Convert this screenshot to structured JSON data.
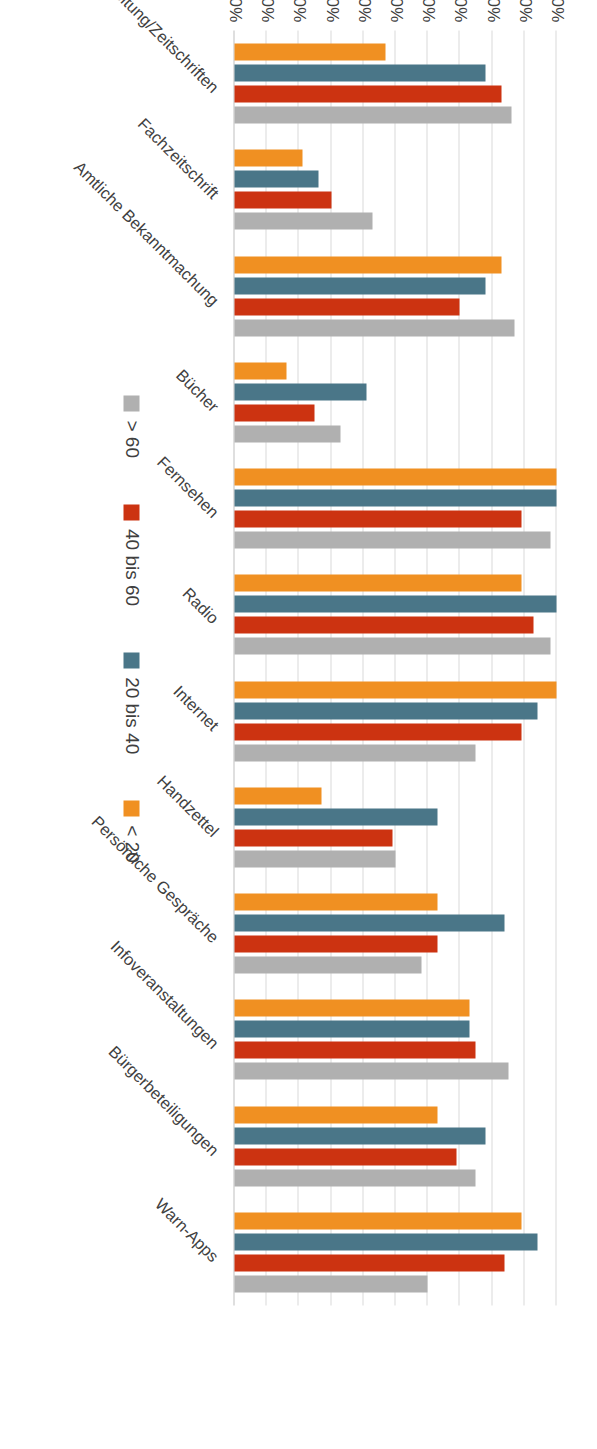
{
  "chart_data": {
    "type": "bar",
    "orientation": "horizontal-bars-rotated-page",
    "title": "",
    "subtitle": "",
    "xlabel": "",
    "ylabel": "",
    "grid": true,
    "legend_position": "right",
    "ylim": [
      0,
      100
    ],
    "value_ticks": [
      "0%",
      "10%",
      "20%",
      "30%",
      "40%",
      "50%",
      "60%",
      "70%",
      "80%",
      "90%",
      "100%"
    ],
    "value_tick_numbers": [
      0,
      10,
      20,
      30,
      40,
      50,
      60,
      70,
      80,
      90,
      100
    ],
    "categories": [
      "Zeitung/Zeitschriften",
      "Fachzeitschrift",
      "Amtliche Bekanntmachung",
      "Bücher",
      "Fernsehen",
      "Radio",
      "Internet",
      "Handzettel",
      "Persönliche Gespräche",
      "Infoveranstaltungen",
      "Bürgerbeteiligungen",
      "Warn-Apps"
    ],
    "series": [
      {
        "name": "< 20",
        "color": "#f09022",
        "values": [
          47,
          21,
          83,
          16,
          100,
          89,
          100,
          27,
          63,
          73,
          63,
          89
        ]
      },
      {
        "name": "20 bis 40",
        "color": "#4a7688",
        "values": [
          78,
          26,
          78,
          41,
          100,
          100,
          94,
          63,
          84,
          73,
          78,
          94
        ]
      },
      {
        "name": "40 bis 60",
        "color": "#cc3311",
        "values": [
          83,
          30,
          70,
          25,
          89,
          93,
          89,
          49,
          63,
          75,
          69,
          84
        ]
      },
      {
        "name": "> 60",
        "color": "#b0b0b0",
        "values": [
          86,
          43,
          87,
          33,
          98,
          98,
          75,
          50,
          58,
          85,
          75,
          60
        ]
      }
    ]
  },
  "legend": {
    "items": [
      {
        "label": "> 60",
        "color": "#b0b0b0"
      },
      {
        "label": "40 bis 60",
        "color": "#cc3311"
      },
      {
        "label": "20 bis 40",
        "color": "#4a7688"
      },
      {
        "label": "< 20",
        "color": "#f09022"
      }
    ]
  },
  "colors": {
    "series_lt20": "#f09022",
    "series_20_40": "#4a7688",
    "series_40_60": "#cc3311",
    "series_gt60": "#b0b0b0",
    "gridline": "#d9d9d9",
    "text": "#3f3f3f",
    "background": "#ffffff"
  }
}
